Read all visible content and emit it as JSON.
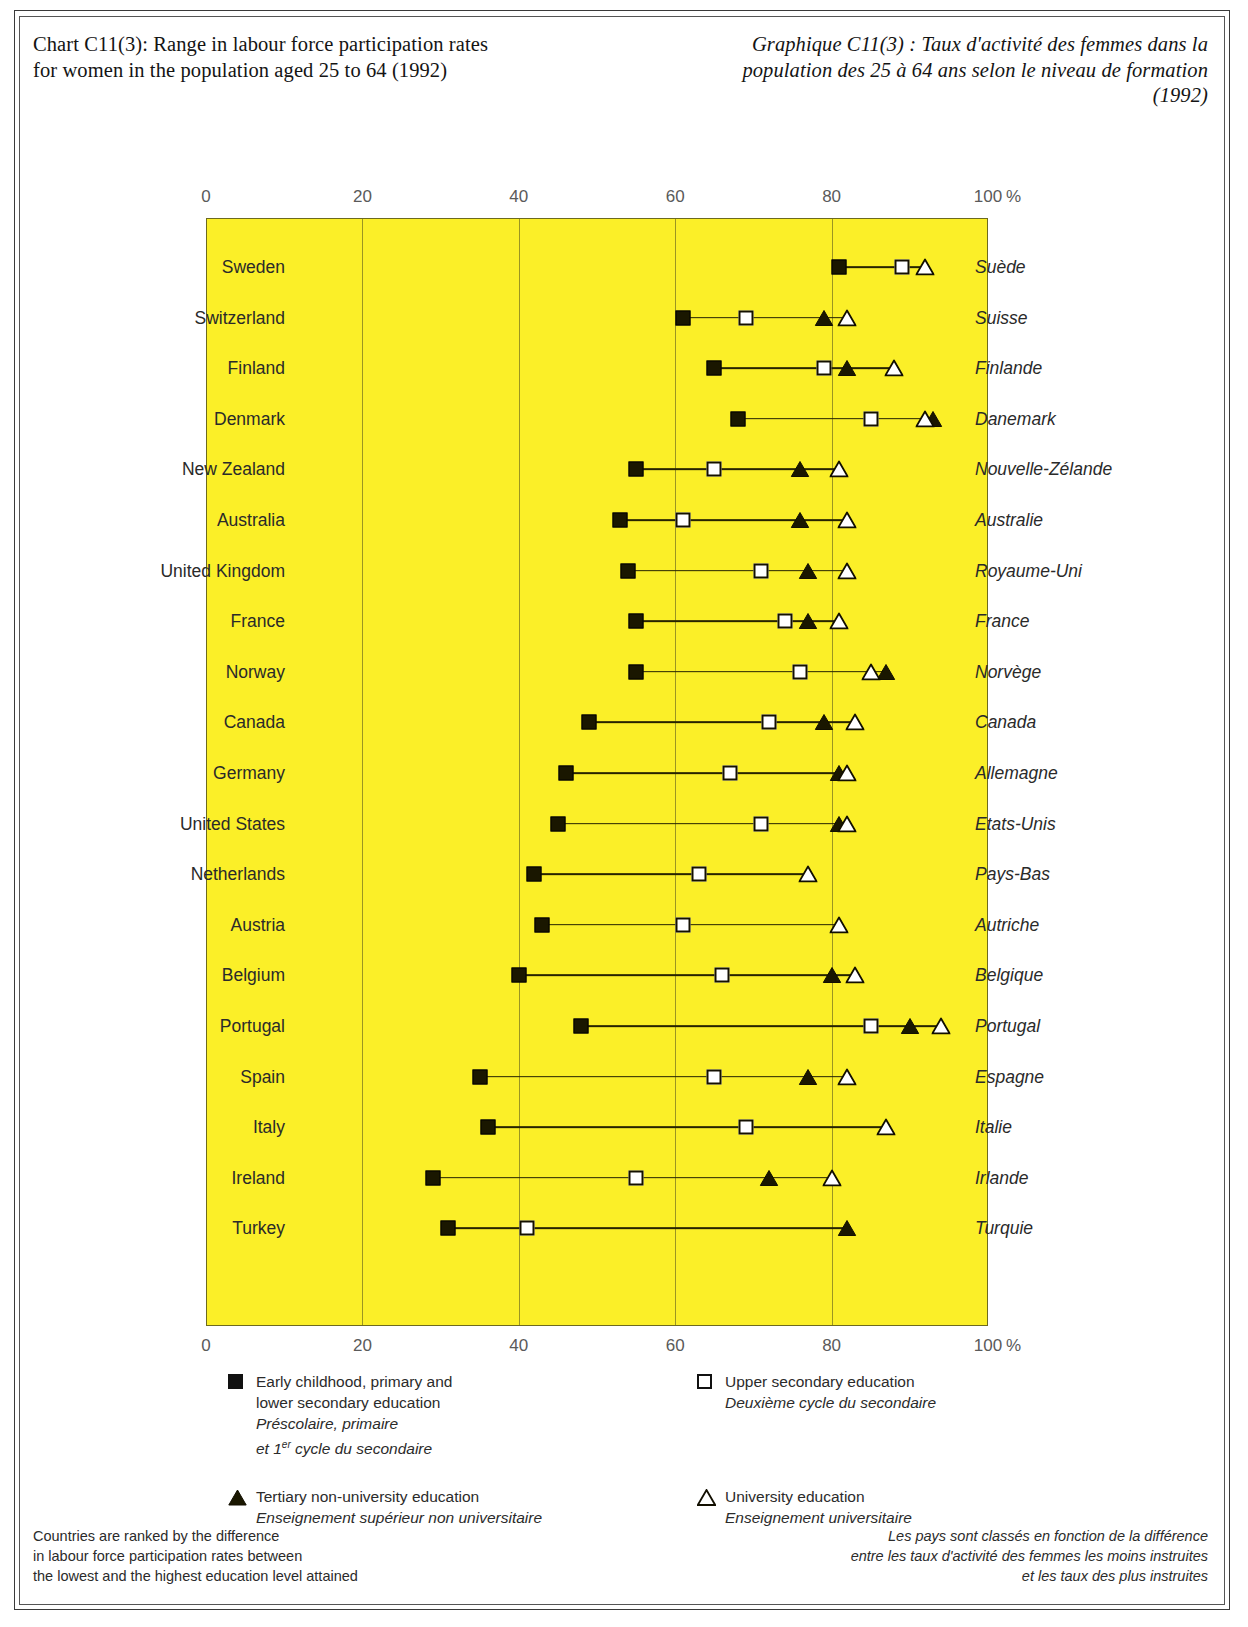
{
  "title": {
    "en": "Chart C11(3):\nRange in labour force participation\nrates for women in the population\naged 25 to 64 (1992)",
    "fr": "Graphique C11(3) :\nTaux d'activité des femmes\ndans la population des 25 à 64 ans\nselon le niveau de formation (1992)"
  },
  "axis": {
    "ticks": [
      "0",
      "20",
      "40",
      "60",
      "80",
      "100"
    ],
    "unit": "%",
    "min": 0,
    "max": 100
  },
  "legend": [
    {
      "id": "early-childhood-primary-lower-secondary",
      "marker": "filled-square",
      "en": "Early childhood, primary and\nlower secondary education",
      "fr": "Préscolaire, primaire\net 1er cycle du secondaire",
      "fr_sup": "er"
    },
    {
      "id": "upper-secondary",
      "marker": "open-square",
      "en": "Upper secondary education",
      "fr": "Deuxième cycle du secondaire"
    },
    {
      "id": "tertiary-non-university",
      "marker": "filled-triangle",
      "en": "Tertiary non-university education",
      "fr": "Enseignement supérieur non universitaire"
    },
    {
      "id": "university",
      "marker": "open-triangle",
      "en": "University education",
      "fr": "Enseignement universitaire"
    }
  ],
  "footnotes": {
    "en": "Countries are ranked by the difference\nin labour force participation rates between\nthe lowest and the highest education level attained",
    "fr": "Les pays sont classés en fonction de la différence\nentre les taux d'activité des femmes les moins instruites\net les taux des plus instruites"
  },
  "colors": {
    "plot_background": "#FBEF28",
    "marker": "#1a1700",
    "line": "#262300",
    "frame": "#3a3a3a"
  },
  "chart_data": {
    "type": "scatter",
    "title": "Range in labour force participation rates for women in the population aged 25 to 64 (1992)",
    "xlabel": "%",
    "ylabel": "",
    "xlim": [
      0,
      100
    ],
    "grid": true,
    "legend_position": "below",
    "series_names": [
      "Early childhood, primary and lower secondary education",
      "Upper secondary education",
      "Tertiary non-university education",
      "University education"
    ],
    "categories": [
      "Sweden",
      "Switzerland",
      "Finland",
      "Denmark",
      "New Zealand",
      "Australia",
      "United Kingdom",
      "France",
      "Norway",
      "Canada",
      "Germany",
      "United States",
      "Netherlands",
      "Austria",
      "Belgium",
      "Portugal",
      "Spain",
      "Italy",
      "Ireland",
      "Turkey"
    ],
    "categories_fr": [
      "Suède",
      "Suisse",
      "Finlande",
      "Danemark",
      "Nouvelle-Zélande",
      "Australie",
      "Royaume-Uni",
      "France",
      "Norvège",
      "Canada",
      "Allemagne",
      "Etats-Unis",
      "Pays-Bas",
      "Autriche",
      "Belgique",
      "Portugal",
      "Espagne",
      "Italie",
      "Irlande",
      "Turquie"
    ],
    "rows": [
      {
        "country": "Sweden",
        "country_fr": "Suède",
        "lower_secondary": 81,
        "upper_secondary": 89,
        "tertiary_non_university": null,
        "university": 92
      },
      {
        "country": "Switzerland",
        "country_fr": "Suisse",
        "lower_secondary": 61,
        "upper_secondary": 69,
        "tertiary_non_university": 79,
        "university": 82
      },
      {
        "country": "Finland",
        "country_fr": "Finlande",
        "lower_secondary": 65,
        "upper_secondary": 79,
        "tertiary_non_university": 82,
        "university": 88
      },
      {
        "country": "Denmark",
        "country_fr": "Danemark",
        "lower_secondary": 68,
        "upper_secondary": 85,
        "tertiary_non_university": 93,
        "university": 92
      },
      {
        "country": "New Zealand",
        "country_fr": "Nouvelle-Zélande",
        "lower_secondary": 55,
        "upper_secondary": 65,
        "tertiary_non_university": 76,
        "university": 81
      },
      {
        "country": "Australia",
        "country_fr": "Australie",
        "lower_secondary": 53,
        "upper_secondary": 61,
        "tertiary_non_university": 76,
        "university": 82
      },
      {
        "country": "United Kingdom",
        "country_fr": "Royaume-Uni",
        "lower_secondary": 54,
        "upper_secondary": 71,
        "tertiary_non_university": 77,
        "university": 82
      },
      {
        "country": "France",
        "country_fr": "France",
        "lower_secondary": 55,
        "upper_secondary": 74,
        "tertiary_non_university": 77,
        "university": 81
      },
      {
        "country": "Norway",
        "country_fr": "Norvège",
        "lower_secondary": 55,
        "upper_secondary": 76,
        "tertiary_non_university": 87,
        "university": 85
      },
      {
        "country": "Canada",
        "country_fr": "Canada",
        "lower_secondary": 49,
        "upper_secondary": 72,
        "tertiary_non_university": 79,
        "university": 83
      },
      {
        "country": "Germany",
        "country_fr": "Allemagne",
        "lower_secondary": 46,
        "upper_secondary": 67,
        "tertiary_non_university": 81,
        "university": 82
      },
      {
        "country": "United States",
        "country_fr": "Etats-Unis",
        "lower_secondary": 45,
        "upper_secondary": 71,
        "tertiary_non_university": 81,
        "university": 82
      },
      {
        "country": "Netherlands",
        "country_fr": "Pays-Bas",
        "lower_secondary": 42,
        "upper_secondary": 63,
        "tertiary_non_university": null,
        "university": 77
      },
      {
        "country": "Austria",
        "country_fr": "Autriche",
        "lower_secondary": 43,
        "upper_secondary": 61,
        "tertiary_non_university": null,
        "university": 81
      },
      {
        "country": "Belgium",
        "country_fr": "Belgique",
        "lower_secondary": 40,
        "upper_secondary": 66,
        "tertiary_non_university": 80,
        "university": 83
      },
      {
        "country": "Portugal",
        "country_fr": "Portugal",
        "lower_secondary": 48,
        "upper_secondary": 85,
        "tertiary_non_university": 90,
        "university": 94
      },
      {
        "country": "Spain",
        "country_fr": "Espagne",
        "lower_secondary": 35,
        "upper_secondary": 65,
        "tertiary_non_university": 77,
        "university": 82
      },
      {
        "country": "Italy",
        "country_fr": "Italie",
        "lower_secondary": 36,
        "upper_secondary": 69,
        "tertiary_non_university": null,
        "university": 87
      },
      {
        "country": "Ireland",
        "country_fr": "Irlande",
        "lower_secondary": 29,
        "upper_secondary": 55,
        "tertiary_non_university": 72,
        "university": 80
      },
      {
        "country": "Turkey",
        "country_fr": "Turquie",
        "lower_secondary": 31,
        "upper_secondary": 41,
        "tertiary_non_university": 82,
        "university": null
      }
    ]
  }
}
